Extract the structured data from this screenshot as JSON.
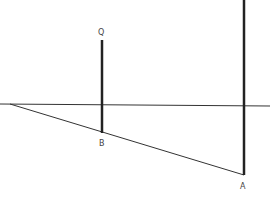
{
  "diagram": {
    "type": "geometry-shadow-figure",
    "colors": {
      "stroke": "#222222",
      "thin_stroke": "#333333",
      "label": "#444444",
      "background": "#ffffff"
    },
    "labels": {
      "Q": "Q",
      "B": "B",
      "A": "A"
    },
    "points": {
      "Q": {
        "x": 102,
        "y": 40
      },
      "B": {
        "x": 102,
        "y": 133
      },
      "A": {
        "x": 244,
        "y": 175
      },
      "P_top": {
        "x": 244,
        "y": 0
      },
      "shadow_start": {
        "x": 10,
        "y": 104
      }
    },
    "ground_line": {
      "y": 105,
      "x1": 0,
      "x2": 270
    }
  }
}
